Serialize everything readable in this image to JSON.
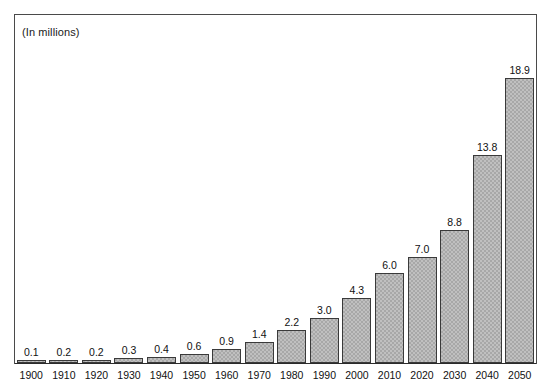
{
  "chart_data": {
    "type": "bar",
    "title": "",
    "subtitle": "(In millions)",
    "xlabel": "",
    "ylabel": "",
    "ylim": [
      0,
      20
    ],
    "grid": false,
    "legend": "none",
    "axis": {
      "x_axis_visible": true,
      "y_axis_visible": false,
      "frame": true
    },
    "categories": [
      "1900",
      "1910",
      "1920",
      "1930",
      "1940",
      "1950",
      "1960",
      "1970",
      "1980",
      "1990",
      "2000",
      "2010",
      "2020",
      "2030",
      "2040",
      "2050"
    ],
    "values": [
      0.1,
      0.2,
      0.2,
      0.3,
      0.4,
      0.6,
      0.9,
      1.4,
      2.2,
      3.0,
      4.3,
      6.0,
      7.0,
      8.8,
      13.8,
      18.9
    ],
    "data_labels": [
      "0.1",
      "0.2",
      "0.2",
      "0.3",
      "0.4",
      "0.6",
      "0.9",
      "1.4",
      "2.2",
      "3.0",
      "4.3",
      "6.0",
      "7.0",
      "8.8",
      "13.8",
      "18.9"
    ],
    "bar_fill_color": "#a8a8a8",
    "bar_border_color": "#3a3a3a",
    "frame_color": "#4a4a4a",
    "text_color": "#111111",
    "background_color": "#ffffff"
  }
}
